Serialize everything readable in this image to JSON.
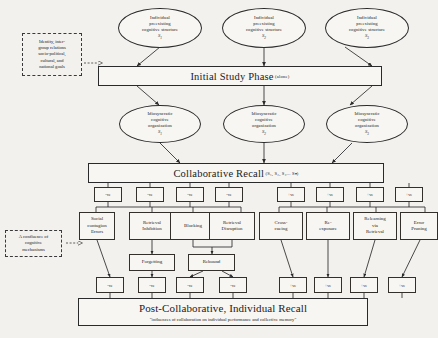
{
  "meta": {
    "ink_color": "#2a2a2a",
    "paper_color": "#f3f1ee"
  },
  "annotations": [
    {
      "id": "identity-note",
      "text": "Identity, inter-group relations socio-political, cultural, and national goals",
      "lines": [
        "Identity, inter-",
        "group relations",
        "socio-political,",
        "cultural, and",
        "national goals"
      ]
    },
    {
      "id": "confluence-note",
      "text": "A confluence of cognitive mechanisms",
      "lines": [
        "A confluence of",
        "cognitive",
        "mechanisms"
      ]
    }
  ],
  "row_preexisting": {
    "label": "Individual preexisting cognitive structure",
    "lines": [
      "Individual",
      "preexisting",
      "cognitive structure"
    ],
    "nodes": [
      {
        "subject": "S",
        "index": "1"
      },
      {
        "subject": "S",
        "index": "2"
      },
      {
        "subject": "S",
        "index": "3"
      }
    ]
  },
  "initial_study": {
    "title": "Initial Study Phase",
    "qualifier": "(alone)"
  },
  "row_idiosyncratic": {
    "label": "Idiosyncratic cognitive organization",
    "lines": [
      "Idiosyncratic",
      "cognitive",
      "organization"
    ],
    "nodes": [
      {
        "subject": "S",
        "index": "1"
      },
      {
        "subject": "S",
        "index": "2"
      },
      {
        "subject": "S",
        "index": "3"
      }
    ]
  },
  "collaborative_recall": {
    "title": "Collaborative Recall",
    "qualifier": "(S₁, S₂, S₃... Sₙ)"
  },
  "valence_row_top": {
    "negative": [
      "-ve",
      "-ve",
      "-ve",
      "-ve"
    ],
    "positive": [
      "+ve",
      "+ve",
      "+ve",
      "+ve"
    ]
  },
  "mechanisms_negative": [
    {
      "id": "social-contagion-errors",
      "lines": [
        "Social",
        "contagion",
        "Errors"
      ]
    },
    {
      "id": "retrieval-inhibition",
      "lines": [
        "Retrieval",
        "Inhibition"
      ]
    },
    {
      "id": "blocking",
      "lines": [
        "Blocking"
      ]
    },
    {
      "id": "retrieval-disruption",
      "lines": [
        "Retrieval",
        "Disruption"
      ]
    }
  ],
  "mechanisms_positive": [
    {
      "id": "cross-cueing",
      "lines": [
        "Cross-",
        "cueing"
      ]
    },
    {
      "id": "re-exposure",
      "lines": [
        "Re-",
        "exposure"
      ]
    },
    {
      "id": "relearning-via-retrieval",
      "lines": [
        "Relearning",
        "via",
        "Retrieval"
      ]
    },
    {
      "id": "error-pruning",
      "lines": [
        "Error",
        "Pruning"
      ]
    }
  ],
  "secondary_effects": [
    {
      "id": "forgetting",
      "label": "Forgetting"
    },
    {
      "id": "rebound",
      "label": "Rebound"
    }
  ],
  "valence_row_bottom": {
    "negative": [
      "-ve",
      "-ve",
      "-ve",
      "-ve"
    ],
    "positive": [
      "+ve",
      "+ve",
      "+ve",
      "+ve"
    ]
  },
  "post_collaborative": {
    "title": "Post-Collaborative, Individual Recall",
    "subtitle": "\"influences of collaboration on individual performance and collective memory\""
  }
}
